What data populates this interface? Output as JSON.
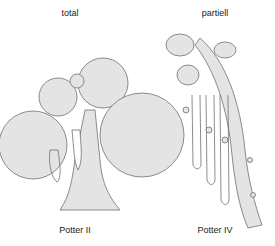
{
  "diagram": {
    "left": {
      "top_label": "total",
      "bottom_label": "Potter II"
    },
    "right": {
      "top_label": "partiell",
      "bottom_label": "Potter IV"
    },
    "colors": {
      "fill": "#e4e4e4",
      "stroke": "#707070",
      "text": "#222222"
    }
  }
}
